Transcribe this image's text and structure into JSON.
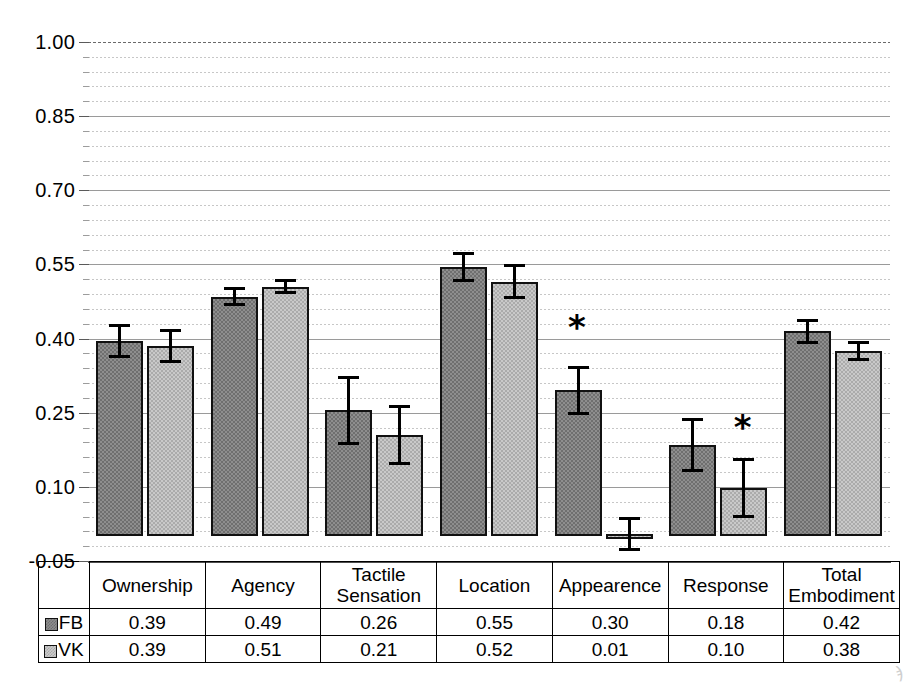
{
  "chart_data": {
    "type": "bar",
    "title": "",
    "xlabel": "",
    "ylabel": "",
    "ylim": [
      -0.05,
      1.0
    ],
    "grid": true,
    "legend_position": "table-left",
    "categories": [
      "Ownership",
      "Agency",
      "Tactile Sensation",
      "Location",
      "Appearence",
      "Response",
      "Total Embodiment"
    ],
    "series": [
      {
        "name": "FB",
        "values": [
          0.39,
          0.49,
          0.26,
          0.55,
          0.3,
          0.18,
          0.42
        ],
        "plotted_values": [
          0.395,
          0.485,
          0.255,
          0.545,
          0.295,
          0.185,
          0.415
        ],
        "errors": [
          0.035,
          0.02,
          0.07,
          0.03,
          0.05,
          0.055,
          0.025
        ],
        "color": "#8e8e8e"
      },
      {
        "name": "VK",
        "values": [
          0.39,
          0.51,
          0.21,
          0.52,
          0.01,
          0.1,
          0.38
        ],
        "plotted_values": [
          0.385,
          0.505,
          0.205,
          0.515,
          0.005,
          0.098,
          0.375
        ],
        "errors": [
          0.035,
          0.015,
          0.06,
          0.035,
          0.035,
          0.06,
          0.02
        ],
        "color": "#c9c9c9"
      }
    ],
    "ytick_labels": [
      "1.00",
      "0.85",
      "0.70",
      "0.55",
      "0.40",
      "0.25",
      "0.10",
      "-0.05"
    ],
    "ytick_values": [
      1.0,
      0.85,
      0.7,
      0.55,
      0.4,
      0.25,
      0.1,
      -0.05
    ],
    "annotations": [
      {
        "symbol": "*",
        "category": "Appearence",
        "note": "significant difference"
      },
      {
        "symbol": "*",
        "category": "Response",
        "note": "significant difference"
      }
    ]
  },
  "axis": {
    "ticks": [
      {
        "label": "1.00",
        "value": 1.0
      },
      {
        "label": "0.85",
        "value": 0.85
      },
      {
        "label": "0.70",
        "value": 0.7
      },
      {
        "label": "0.55",
        "value": 0.55
      },
      {
        "label": "0.40",
        "value": 0.4
      },
      {
        "label": "0.25",
        "value": 0.25
      },
      {
        "label": "0.10",
        "value": 0.1
      },
      {
        "label": "-0.05",
        "value": -0.05
      }
    ]
  },
  "table": {
    "corner_label": "",
    "headers": [
      "Ownership",
      "Agency",
      "Tactile\nSensation",
      "Location",
      "Appearence",
      "Response",
      "Total\nEmbodiment"
    ],
    "headers_line1": [
      "Ownership",
      "Agency",
      "Tactile",
      "Location",
      "Appearence",
      "Response",
      "Total"
    ],
    "headers_line2": [
      "",
      "",
      "Sensation",
      "",
      "",
      "",
      "Embodiment"
    ],
    "rows": [
      {
        "legend": "FB",
        "swatch": "fb-pattern-swatch",
        "values": [
          "0.39",
          "0.49",
          "0.26",
          "0.55",
          "0.30",
          "0.18",
          "0.42"
        ]
      },
      {
        "legend": "VK",
        "swatch": "vk-pattern-swatch",
        "values": [
          "0.39",
          "0.51",
          "0.21",
          "0.52",
          "0.01",
          "0.10",
          "0.38"
        ]
      }
    ]
  },
  "annotation_marks": [
    {
      "symbol": "*"
    },
    {
      "symbol": "*"
    }
  ],
  "colors": {
    "fb_fill": "#8e8e8e",
    "vk_fill": "#c9c9c9",
    "bar_outline": "#111111",
    "grid_major": "#9a9a9a",
    "grid_minor": "#bdbdbd",
    "axis": "#4d4d4d"
  }
}
